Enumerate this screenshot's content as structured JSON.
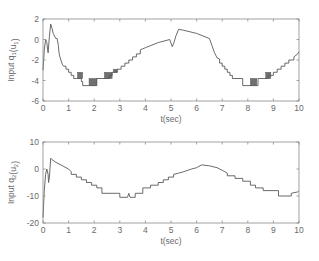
{
  "chart_data": [
    {
      "type": "line",
      "title": "",
      "xlabel": "t(sec)",
      "ylabel": "Input q_1(u_1)",
      "ylabel_main": "Input q",
      "ylabel_sub1": "1",
      "ylabel_mid": "(u",
      "ylabel_sub2": "1",
      "ylabel_end": ")",
      "xlim": [
        0,
        10
      ],
      "ylim": [
        -6,
        2
      ],
      "xticks": [
        0,
        1,
        2,
        3,
        4,
        5,
        6,
        7,
        8,
        9,
        10
      ],
      "yticks": [
        2,
        0,
        -2,
        -4,
        -6
      ],
      "grid": false,
      "legend": null,
      "color": "#5a5a5a",
      "series": [
        {
          "name": "u1",
          "x": [
            0,
            0.05,
            0.1,
            0.15,
            0.2,
            0.25,
            0.3,
            0.35,
            0.4,
            0.5,
            0.55,
            0.6,
            0.62,
            0.65,
            0.7,
            0.75,
            0.8,
            0.9,
            0.9,
            1.0,
            1.0,
            1.1,
            1.1,
            1.2,
            1.2,
            1.3,
            1.3,
            1.5,
            1.5,
            1.55,
            1.55,
            2.1,
            2.1,
            2.15,
            2.15,
            2.6,
            2.6,
            2.7,
            2.7,
            2.9,
            2.9,
            3.05,
            3.05,
            3.2,
            3.2,
            3.35,
            3.35,
            3.5,
            3.5,
            3.65,
            3.65,
            3.8,
            3.8,
            4.0,
            4.5,
            4.95,
            5.05,
            5.1,
            5.2,
            5.3,
            5.5,
            6.0,
            6.5,
            6.6,
            6.7,
            6.8,
            6.9,
            6.9,
            7.0,
            7.0,
            7.1,
            7.1,
            7.2,
            7.2,
            7.3,
            7.3,
            7.4,
            7.4,
            7.5,
            7.5,
            7.8,
            7.8,
            8.3,
            8.3,
            8.4,
            8.4,
            8.8,
            8.8,
            9.0,
            9.0,
            9.15,
            9.15,
            9.3,
            9.3,
            9.45,
            9.45,
            9.6,
            9.6,
            9.8,
            9.8,
            9.95,
            10.0
          ],
          "y": [
            -3.0,
            -1.0,
            0.0,
            -0.3,
            -1.3,
            0.3,
            1.5,
            1.1,
            0.6,
            0.1,
            0.1,
            -0.6,
            -1.2,
            -1.6,
            -2.0,
            -2.4,
            -2.6,
            -2.6,
            -2.9,
            -2.9,
            -3.2,
            -3.2,
            -3.5,
            -3.5,
            -3.8,
            -3.8,
            -3.8,
            -3.8,
            -4.1,
            -4.1,
            -4.5,
            -4.5,
            -3.8,
            -3.8,
            -3.8,
            -3.8,
            -3.5,
            -3.5,
            -3.2,
            -3.2,
            -2.9,
            -2.9,
            -2.6,
            -2.6,
            -2.3,
            -2.3,
            -2.0,
            -2.0,
            -1.7,
            -1.7,
            -1.4,
            -1.4,
            -1.0,
            -0.8,
            -0.3,
            0.0,
            -0.7,
            -0.4,
            0.4,
            1.0,
            0.9,
            0.6,
            0.1,
            -0.6,
            -1.3,
            -1.8,
            -1.9,
            -2.3,
            -2.3,
            -2.6,
            -2.6,
            -2.9,
            -2.9,
            -3.2,
            -3.2,
            -3.5,
            -3.5,
            -3.8,
            -3.8,
            -3.8,
            -3.8,
            -4.5,
            -4.5,
            -4.5,
            -4.5,
            -3.8,
            -3.8,
            -3.5,
            -3.5,
            -3.2,
            -3.2,
            -2.9,
            -2.9,
            -2.6,
            -2.6,
            -2.3,
            -2.3,
            -2.0,
            -2.0,
            -1.7,
            -1.4,
            -1.2
          ]
        }
      ],
      "chatter_regions": [
        {
          "x0": 1.35,
          "x1": 1.55,
          "y0": -3.8,
          "y1": -3.2
        },
        {
          "x0": 1.8,
          "x1": 2.1,
          "y0": -4.5,
          "y1": -3.8
        },
        {
          "x0": 2.4,
          "x1": 2.7,
          "y0": -3.8,
          "y1": -3.2
        },
        {
          "x0": 2.75,
          "x1": 2.9,
          "y0": -3.2,
          "y1": -2.9
        },
        {
          "x0": 8.1,
          "x1": 8.35,
          "y0": -4.5,
          "y1": -3.8
        },
        {
          "x0": 8.7,
          "x1": 8.9,
          "y0": -3.8,
          "y1": -3.2
        }
      ]
    },
    {
      "type": "line",
      "title": "",
      "xlabel": "t(sec)",
      "ylabel": "Input q_2(u_2)",
      "ylabel_main": "Input q",
      "ylabel_sub1": "2",
      "ylabel_mid": "(u",
      "ylabel_sub2": "2",
      "ylabel_end": ")",
      "xlim": [
        0,
        10
      ],
      "ylim": [
        -20,
        10
      ],
      "xticks": [
        0,
        1,
        2,
        3,
        4,
        5,
        6,
        7,
        8,
        9,
        10
      ],
      "yticks": [
        10,
        0,
        -10,
        -20
      ],
      "grid": false,
      "legend": null,
      "color": "#5a5a5a",
      "series": [
        {
          "name": "u2",
          "x": [
            0,
            0.05,
            0.1,
            0.15,
            0.2,
            0.22,
            0.25,
            0.3,
            0.35,
            0.5,
            0.7,
            0.9,
            1.0,
            1.1,
            1.1,
            1.3,
            1.3,
            1.5,
            1.5,
            1.7,
            1.7,
            1.9,
            1.9,
            2.1,
            2.1,
            2.3,
            2.3,
            3.0,
            3.0,
            3.3,
            3.35,
            3.4,
            3.45,
            3.6,
            3.6,
            3.9,
            3.9,
            4.2,
            4.2,
            4.5,
            4.5,
            4.7,
            4.7,
            4.9,
            4.9,
            5.1,
            5.1,
            5.3,
            5.5,
            5.8,
            6.0,
            6.2,
            6.5,
            6.8,
            7.0,
            7.1,
            7.2,
            7.2,
            7.5,
            7.5,
            7.8,
            7.8,
            8.1,
            8.1,
            8.3,
            8.3,
            8.6,
            8.6,
            9.2,
            9.2,
            9.7,
            9.7,
            9.95,
            10.0
          ],
          "y": [
            -18,
            -8,
            -2,
            0,
            -2,
            -5,
            -3,
            4,
            3.5,
            2.5,
            1.5,
            0.5,
            0,
            -1,
            -2,
            -2,
            -3,
            -3,
            -4,
            -4,
            -5,
            -5,
            -6,
            -6,
            -7,
            -7,
            -9,
            -9,
            -10.5,
            -10.5,
            -9,
            -10.5,
            -10.5,
            -10.5,
            -9,
            -9,
            -7,
            -7,
            -6,
            -6,
            -5,
            -5,
            -4,
            -4,
            -3,
            -3,
            -2,
            -1.5,
            -1,
            0,
            0.5,
            1.5,
            1.2,
            0.5,
            -0.5,
            -1,
            -1.5,
            -2.5,
            -2.5,
            -3.5,
            -3.5,
            -4.5,
            -4.5,
            -6,
            -6,
            -7,
            -7,
            -8,
            -8,
            -10,
            -10,
            -9,
            -8.5,
            -8
          ]
        }
      ]
    }
  ]
}
